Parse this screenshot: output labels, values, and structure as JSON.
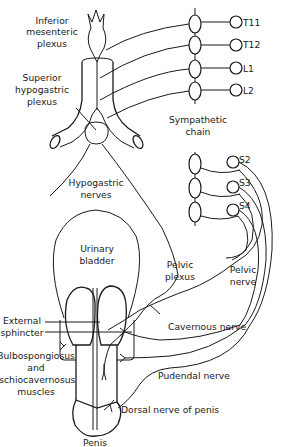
{
  "figure": {
    "labels": {
      "inferior_mesenteric_1": "Inferior",
      "inferior_mesenteric_2": "mesenteric",
      "inferior_mesenteric_3": "plexus",
      "superior_hypogastric_1": "Superior",
      "superior_hypogastric_2": "hypogastric",
      "superior_hypogastric_3": "plexus",
      "sympathetic_chain_1": "Sympathetic",
      "sympathetic_chain_2": "chain",
      "hypogastric_nerves_1": "Hypogastric",
      "hypogastric_nerves_2": "nerves",
      "urinary_bladder_1": "Urinary",
      "urinary_bladder_2": "bladder",
      "pelvic_plexus_1": "Pelvic",
      "pelvic_plexus_2": "plexus",
      "pelvic_nerve_1": "Pelvic",
      "pelvic_nerve_2": "nerve",
      "external_sphincter_1": "External",
      "external_sphincter_2": "sphincter",
      "bulbo_1": "Bulbospongiosus",
      "bulbo_2": "and",
      "bulbo_3": "ischiocavernosus",
      "bulbo_4": "muscles",
      "cavernous_nerve": "Cavernous nerve",
      "pudendal_nerve": "Pudendal nerve",
      "dorsal_nerve": "Dorsal nerve of penis",
      "penis": "Penis"
    },
    "spinal_segments": {
      "thoracolumbar": [
        "T11",
        "T12",
        "L1",
        "L2"
      ],
      "sacral": [
        "S2",
        "S3",
        "S4"
      ]
    },
    "colors": {
      "line": "#1a1a1a",
      "background": "#ffffff"
    }
  }
}
